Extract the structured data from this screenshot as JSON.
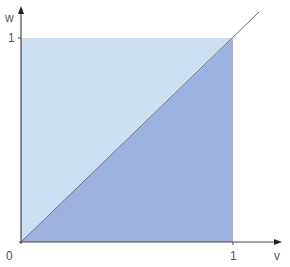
{
  "diagram": {
    "axis_labels": {
      "x": "v",
      "y": "w"
    },
    "ticks": {
      "origin": "0",
      "x_one": "1",
      "y_one": "1"
    },
    "colors": {
      "upper_triangle": "#cfdff3",
      "lower_triangle": "#9db2de",
      "axis": "#444444",
      "diagonal": "#777777"
    },
    "regions": [
      {
        "name": "upper-triangle",
        "description": "w > v within unit square"
      },
      {
        "name": "lower-triangle",
        "description": "w < v within unit square"
      }
    ]
  }
}
